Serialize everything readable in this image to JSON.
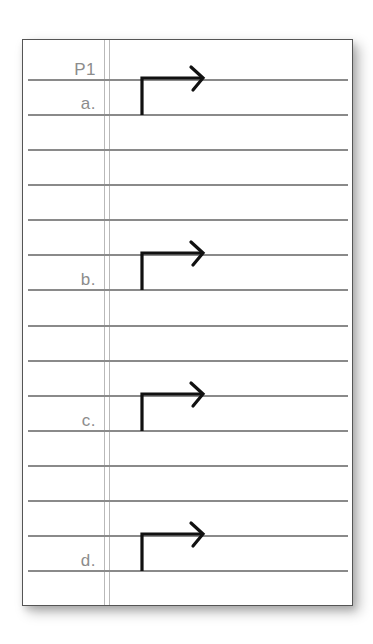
{
  "worksheet": {
    "title": "P1",
    "colors": {
      "border": "#555555",
      "rule": "#8a8a8a",
      "margin": "#b9b9b9",
      "label": "#8c8c8c",
      "arrow": "#111111"
    },
    "rules_count": 15,
    "items": [
      {
        "label": "a.",
        "arrow": "bent-right-arrow"
      },
      {
        "label": "b.",
        "arrow": "bent-right-arrow"
      },
      {
        "label": "c.",
        "arrow": "bent-right-arrow"
      },
      {
        "label": "d.",
        "arrow": "bent-right-arrow"
      }
    ]
  }
}
